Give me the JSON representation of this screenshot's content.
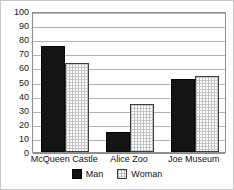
{
  "chart_data": {
    "type": "bar",
    "title": "",
    "xlabel": "",
    "ylabel": "",
    "ylim": [
      0,
      100
    ],
    "ytick_step": 10,
    "yticks": [
      100,
      90,
      80,
      70,
      60,
      50,
      40,
      30,
      20,
      10,
      0
    ],
    "grid": true,
    "legend_position": "bottom-center",
    "categories": [
      "McQueen Castle",
      "Alice Zoo",
      "Joe Museum"
    ],
    "series": [
      {
        "name": "Man",
        "values": [
          75,
          14,
          52
        ],
        "color": "#141414",
        "fill": "solid"
      },
      {
        "name": "Woman",
        "values": [
          63,
          34,
          54
        ],
        "color": "#fcfcfc",
        "fill": "crosshatch"
      }
    ]
  },
  "legend": {
    "entries": [
      {
        "label": "Man"
      },
      {
        "label": "Woman"
      }
    ]
  }
}
